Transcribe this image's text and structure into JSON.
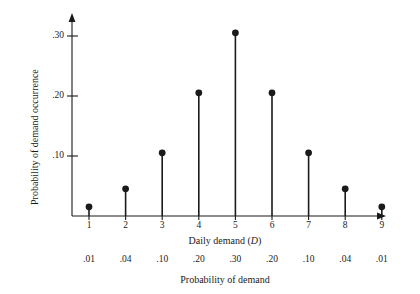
{
  "chart_data": {
    "type": "bar",
    "style": "stem-lollipop",
    "title": "",
    "xlabel": "Daily demand (D)",
    "ylabel": "Probability of demand occurrence",
    "caption": "Probability of demand",
    "categories": [
      "1",
      "2",
      "3",
      "4",
      "5",
      "6",
      "7",
      "8",
      "9"
    ],
    "values": [
      0.01,
      0.04,
      0.1,
      0.2,
      0.3,
      0.2,
      0.1,
      0.04,
      0.01
    ],
    "value_labels": [
      ".01",
      ".04",
      ".10",
      ".20",
      ".30",
      ".20",
      ".10",
      ".04",
      ".01"
    ],
    "ytick_values": [
      0.1,
      0.2,
      0.3
    ],
    "ytick_labels": [
      ".10",
      ".20",
      ".30"
    ],
    "xlim": [
      0.4,
      9.9
    ],
    "ylim": [
      0,
      0.345
    ],
    "grid": false,
    "legend": null,
    "marker_color": "#1a1a1a",
    "axis_color": "#1a1a1a",
    "background": "#ffffff"
  },
  "axis_titles": {
    "x_prefix": "Daily demand (",
    "x_italic": "D",
    "x_suffix": ")",
    "y": "Probability of demand occurrence",
    "bottom_caption": "Probability of demand"
  }
}
